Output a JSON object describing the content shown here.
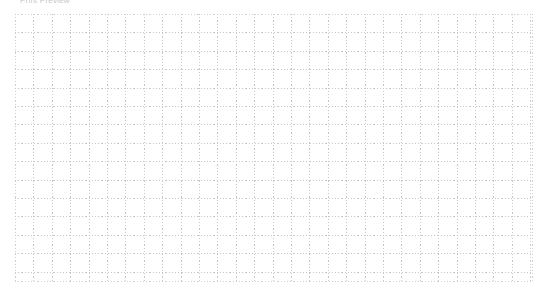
{
  "page": {
    "width": 553,
    "height": 300,
    "background_color": "#ffffff"
  },
  "header": {
    "caption": "Print Preview",
    "text_color": "#c6c6cb",
    "clipped_at_top": true
  },
  "grid": {
    "label": "dotted worksheet grid",
    "left": 15,
    "top": 14,
    "width": 518,
    "height": 268,
    "cell_size": 18.4,
    "columns": 28,
    "rows": 14,
    "line_color": "#c7c7cc",
    "line_style": "dotted",
    "fill_color": "#ffffff",
    "has_outer_frame": true
  }
}
